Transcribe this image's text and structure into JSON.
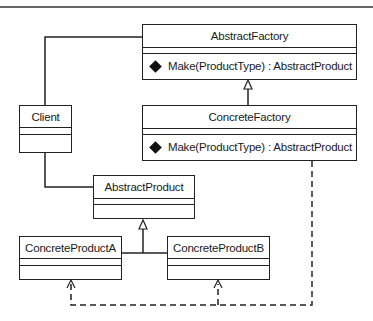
{
  "diagram": {
    "type": "UML class diagram",
    "classes": {
      "abstract_factory": {
        "name": "AbstractFactory",
        "operation": "Make(ProductType) : AbstractProduct"
      },
      "concrete_factory": {
        "name": "ConcreteFactory",
        "operation": "Make(ProductType) : AbstractProduct"
      },
      "client": {
        "name": "Client"
      },
      "abstract_product": {
        "name": "AbstractProduct"
      },
      "concrete_product_a": {
        "name": "ConcreteProductA"
      },
      "concrete_product_b": {
        "name": "ConcreteProductB"
      }
    },
    "relationships": [
      {
        "from": "Client",
        "to": "AbstractFactory",
        "kind": "association"
      },
      {
        "from": "Client",
        "to": "AbstractProduct",
        "kind": "association"
      },
      {
        "from": "ConcreteFactory",
        "to": "AbstractFactory",
        "kind": "generalization"
      },
      {
        "from": "ConcreteProductA",
        "to": "AbstractProduct",
        "kind": "generalization"
      },
      {
        "from": "ConcreteProductB",
        "to": "AbstractProduct",
        "kind": "generalization"
      },
      {
        "from": "ConcreteFactory",
        "to": "ConcreteProductA",
        "kind": "dependency"
      },
      {
        "from": "ConcreteFactory",
        "to": "ConcreteProductB",
        "kind": "dependency"
      }
    ],
    "colors": {
      "line": "#222222",
      "background": "#ffffff"
    }
  }
}
